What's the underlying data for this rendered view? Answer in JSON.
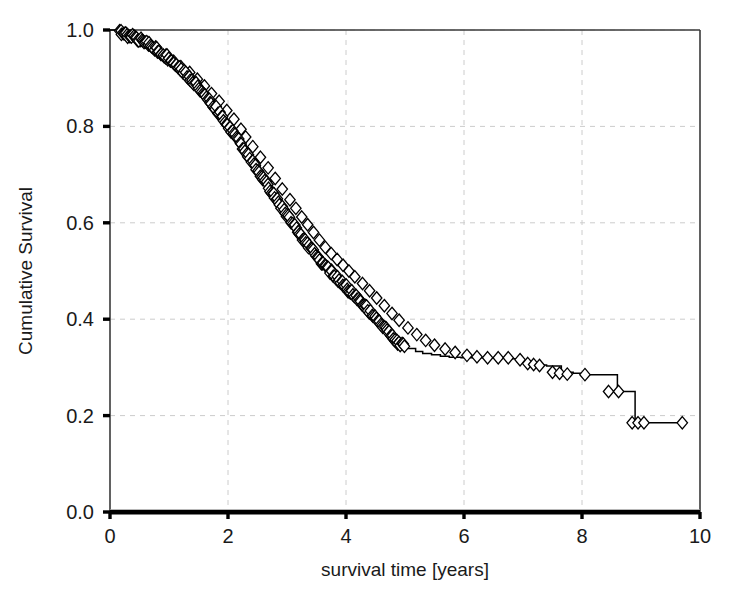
{
  "figure": {
    "width": 729,
    "height": 599,
    "background_color": "#ffffff"
  },
  "chart_data": {
    "type": "line",
    "subtype": "kaplan-meier-step",
    "title": "",
    "subtitle": "",
    "xlabel": "survival time [years]",
    "ylabel": "Cumulative Survival",
    "xlim": [
      0,
      10
    ],
    "ylim": [
      0.0,
      1.0
    ],
    "xticks": [
      0,
      2,
      4,
      6,
      8,
      10
    ],
    "xtick_labels": [
      "0",
      "2",
      "4",
      "6",
      "8",
      "10"
    ],
    "yticks": [
      0.0,
      0.2,
      0.4,
      0.6,
      0.8,
      1.0
    ],
    "ytick_labels": [
      "0.0",
      "0.2",
      "0.4",
      "0.6",
      "0.8",
      "1.0"
    ],
    "grid": true,
    "grid_style": "dashed",
    "grid_color": "#cccccc",
    "legend": null,
    "annotations": [],
    "series": [
      {
        "name": "Cumulative Survival",
        "line_color": "#000000",
        "marker": "open-diamond",
        "marker_label": "censored observation",
        "step_type": "post",
        "x": [
          0.0,
          0.12,
          0.22,
          0.3,
          0.38,
          0.46,
          0.54,
          0.62,
          0.7,
          0.78,
          0.86,
          0.94,
          1.02,
          1.1,
          1.18,
          1.26,
          1.34,
          1.42,
          1.5,
          1.58,
          1.66,
          1.74,
          1.82,
          1.9,
          1.98,
          2.06,
          2.14,
          2.22,
          2.3,
          2.38,
          2.46,
          2.54,
          2.62,
          2.7,
          2.78,
          2.86,
          2.94,
          3.02,
          3.1,
          3.18,
          3.26,
          3.34,
          3.42,
          3.5,
          3.58,
          3.66,
          3.74,
          3.82,
          3.9,
          3.98,
          4.06,
          4.14,
          4.22,
          4.3,
          4.38,
          4.46,
          4.54,
          4.62,
          4.7,
          4.78,
          4.86,
          4.94,
          5.05,
          5.18,
          5.3,
          5.45,
          5.6,
          5.75,
          5.95,
          6.15,
          6.35,
          6.55,
          6.7,
          6.9,
          7.05,
          7.2,
          7.4,
          7.65,
          7.85,
          8.05,
          8.35,
          8.6,
          8.8,
          8.9,
          9.0,
          9.2,
          9.7
        ],
        "y": [
          1.0,
          0.997,
          0.993,
          0.99,
          0.986,
          0.982,
          0.977,
          0.972,
          0.966,
          0.96,
          0.953,
          0.946,
          0.938,
          0.93,
          0.921,
          0.912,
          0.902,
          0.892,
          0.881,
          0.87,
          0.858,
          0.846,
          0.833,
          0.82,
          0.806,
          0.792,
          0.778,
          0.763,
          0.748,
          0.733,
          0.718,
          0.703,
          0.688,
          0.672,
          0.657,
          0.642,
          0.627,
          0.612,
          0.597,
          0.583,
          0.569,
          0.556,
          0.543,
          0.531,
          0.52,
          0.509,
          0.499,
          0.489,
          0.479,
          0.469,
          0.459,
          0.449,
          0.439,
          0.429,
          0.419,
          0.409,
          0.398,
          0.387,
          0.376,
          0.365,
          0.355,
          0.346,
          0.339,
          0.333,
          0.329,
          0.326,
          0.323,
          0.321,
          0.32,
          0.32,
          0.32,
          0.32,
          0.318,
          0.312,
          0.308,
          0.305,
          0.303,
          0.29,
          0.288,
          0.285,
          0.285,
          0.25,
          0.25,
          0.185,
          0.185,
          0.185,
          0.185
        ],
        "censor_x": [
          0.3,
          0.52,
          0.66,
          0.8,
          0.95,
          1.08,
          1.2,
          1.35,
          1.48,
          1.6,
          1.72,
          1.85,
          1.98,
          2.1,
          2.22,
          2.3,
          2.42,
          2.55,
          2.68,
          2.8,
          2.92,
          3.05,
          3.15,
          3.25,
          3.35,
          3.45,
          3.55,
          3.65,
          3.75,
          3.85,
          3.95,
          4.05,
          4.15,
          4.28,
          4.4,
          4.52,
          4.65,
          4.78,
          4.9,
          5.05,
          5.2,
          5.35,
          5.5,
          5.68,
          5.85,
          6.05,
          6.22,
          6.4,
          6.58,
          6.75,
          6.95,
          7.08,
          7.18,
          7.28,
          7.5,
          7.62,
          7.75,
          8.05,
          8.45,
          8.62,
          8.85,
          8.95,
          9.05,
          9.7
        ],
        "censor_y": [
          0.99,
          0.978,
          0.969,
          0.958,
          0.948,
          0.935,
          0.924,
          0.912,
          0.898,
          0.884,
          0.868,
          0.852,
          0.833,
          0.815,
          0.794,
          0.778,
          0.758,
          0.736,
          0.714,
          0.692,
          0.67,
          0.648,
          0.63,
          0.612,
          0.596,
          0.58,
          0.564,
          0.549,
          0.536,
          0.524,
          0.512,
          0.5,
          0.488,
          0.474,
          0.459,
          0.444,
          0.428,
          0.412,
          0.398,
          0.382,
          0.368,
          0.356,
          0.346,
          0.338,
          0.331,
          0.325,
          0.322,
          0.32,
          0.32,
          0.32,
          0.316,
          0.308,
          0.306,
          0.304,
          0.29,
          0.288,
          0.286,
          0.285,
          0.25,
          0.25,
          0.185,
          0.185,
          0.185,
          0.185
        ]
      }
    ]
  },
  "axes": {
    "frame_color": "#3a3a3a",
    "bottom_axis_color": "#000000",
    "tick_color": "#000000"
  }
}
